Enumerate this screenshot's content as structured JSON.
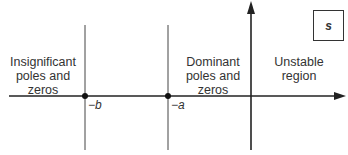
{
  "diagram": {
    "type": "s-plane region diagram",
    "plane_label": "s",
    "regions": [
      {
        "id": "insignificant",
        "label": "Insignificant poles and zeros",
        "lines": [
          "Insignificant",
          "poles and",
          "zeros"
        ]
      },
      {
        "id": "dominant",
        "label": "Dominant poles and zeros",
        "lines": [
          "Dominant",
          "poles and",
          "zeros"
        ]
      },
      {
        "id": "unstable",
        "label": "Unstable region",
        "lines": [
          "Unstable",
          "region"
        ]
      }
    ],
    "markers": [
      {
        "id": "minus-b",
        "label": "−b"
      },
      {
        "id": "minus-a",
        "label": "−a"
      }
    ]
  }
}
